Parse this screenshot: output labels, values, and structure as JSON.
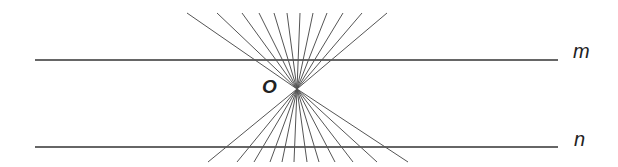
{
  "diagram": {
    "title": "",
    "point_label": "O",
    "line_labels": {
      "m": "m",
      "n": "n"
    },
    "center": [
      297,
      89
    ],
    "lines": {
      "m": {
        "x1": 35,
        "x2": 558,
        "y": 60
      },
      "n": {
        "x1": 35,
        "x2": 558,
        "y": 147
      }
    },
    "pencil_top_endpoints_x": [
      187,
      217,
      242,
      259,
      274,
      287,
      300,
      313,
      327,
      343,
      362,
      387
    ],
    "pencil_top_y": 13,
    "pencil_bottom_endpoints_x": [
      208,
      237,
      254,
      270,
      282,
      294,
      307,
      319,
      335,
      353,
      377,
      408
    ],
    "pencil_bottom_y": 162,
    "colors": {
      "lines": "#333333",
      "rays": "#555555",
      "text": "#222222"
    }
  }
}
